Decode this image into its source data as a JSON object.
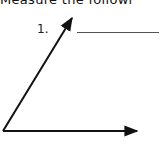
{
  "worksheet": {
    "instruction": "Measure the followi",
    "problems": [
      {
        "number": "1.",
        "answer": "",
        "figure": {
          "type": "angle",
          "vertex": [
            3,
            131
          ],
          "ray_1_end": [
            139,
            131
          ],
          "ray_2_end": [
            73,
            16
          ]
        }
      }
    ]
  },
  "colors": {
    "ink": "#111111",
    "blank_line": "#555555"
  }
}
